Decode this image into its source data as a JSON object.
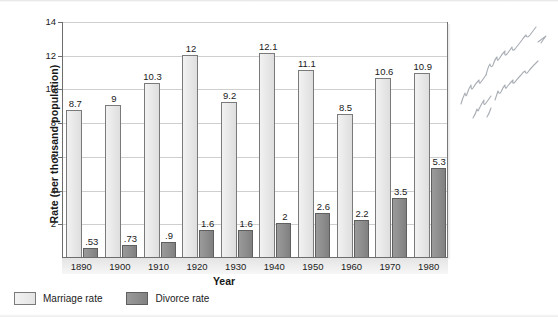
{
  "chart_data": {
    "type": "bar",
    "title": "",
    "xlabel": "Year",
    "ylabel": "Rate (per thousand population)",
    "categories": [
      "1890",
      "1900",
      "1910",
      "1920",
      "1930",
      "1940",
      "1950",
      "1960",
      "1970",
      "1980"
    ],
    "series": [
      {
        "name": "Marriage rate",
        "color": "#e6e6e6",
        "values": [
          8.7,
          9,
          10.3,
          12,
          9.2,
          12.1,
          11.1,
          8.5,
          10.6,
          10.9
        ],
        "labels": [
          "8.7",
          "9",
          "10.3",
          "12",
          "9.2",
          "12.1",
          "11.1",
          "8.5",
          "10.6",
          "10.9"
        ]
      },
      {
        "name": "Divorce rate",
        "color": "#8c8c8c",
        "values": [
          0.53,
          0.73,
          0.9,
          1.6,
          1.6,
          2,
          2.6,
          2.2,
          3.5,
          5.3
        ],
        "labels": [
          ".53",
          ".73",
          ".9",
          "1.6",
          "1.6",
          "2",
          "2.6",
          "2.2",
          "3.5",
          "5.3"
        ]
      }
    ],
    "ylim": [
      0,
      14
    ],
    "yticks": [
      0,
      2,
      4,
      6,
      8,
      10,
      12,
      14
    ],
    "ytick_labels": [
      "",
      "2",
      "4",
      "6",
      "8",
      "10",
      "12",
      "14"
    ],
    "grid": "horizontal",
    "legend_position": "bottom-left"
  },
  "legend": {
    "entries": [
      {
        "label": "Marriage rate",
        "swatch": "marriage-swatch"
      },
      {
        "label": "Divorce rate",
        "swatch": "divorce-swatch"
      }
    ]
  },
  "annotations": {
    "margin_note": "more marriages, more divorces"
  }
}
